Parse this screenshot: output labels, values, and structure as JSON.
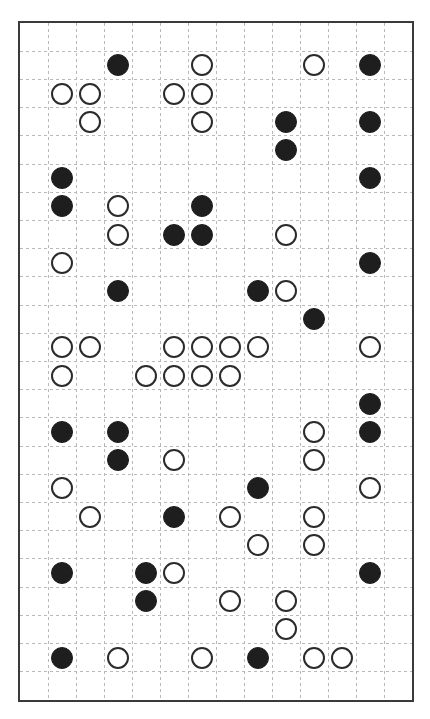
{
  "canvas": {
    "width": 430,
    "height": 719,
    "background": "#ffffff"
  },
  "board": {
    "label": "dashed-grid-board",
    "left": 18,
    "top": 21,
    "width": 396,
    "height": 681,
    "border_color": "#3a3a3a",
    "border_width": 2,
    "grid_color": "#b9b9b9",
    "grid_dash": "3 3",
    "columns": 14,
    "rows": 24,
    "cell_size": 28.3
  },
  "stones": {
    "black_color": "#1e1e1e",
    "white_fill": "#ffffff",
    "white_stroke": "#2b2b2b",
    "diameter": 22,
    "black_count": 34,
    "white_count": 45,
    "total_count": 79,
    "items": [
      {
        "row": 1,
        "col": 3,
        "color": "black"
      },
      {
        "row": 1,
        "col": 6,
        "color": "white"
      },
      {
        "row": 1,
        "col": 10,
        "color": "white"
      },
      {
        "row": 1,
        "col": 12,
        "color": "black"
      },
      {
        "row": 2,
        "col": 1,
        "color": "white"
      },
      {
        "row": 2,
        "col": 2,
        "color": "white"
      },
      {
        "row": 2,
        "col": 5,
        "color": "white"
      },
      {
        "row": 2,
        "col": 6,
        "color": "white"
      },
      {
        "row": 3,
        "col": 2,
        "color": "white"
      },
      {
        "row": 3,
        "col": 6,
        "color": "white"
      },
      {
        "row": 3,
        "col": 9,
        "color": "black"
      },
      {
        "row": 3,
        "col": 12,
        "color": "black"
      },
      {
        "row": 4,
        "col": 9,
        "color": "black"
      },
      {
        "row": 5,
        "col": 1,
        "color": "black"
      },
      {
        "row": 5,
        "col": 12,
        "color": "black"
      },
      {
        "row": 6,
        "col": 1,
        "color": "black"
      },
      {
        "row": 6,
        "col": 3,
        "color": "white"
      },
      {
        "row": 6,
        "col": 6,
        "color": "black"
      },
      {
        "row": 7,
        "col": 3,
        "color": "white"
      },
      {
        "row": 7,
        "col": 5,
        "color": "black"
      },
      {
        "row": 7,
        "col": 6,
        "color": "black"
      },
      {
        "row": 7,
        "col": 9,
        "color": "white"
      },
      {
        "row": 8,
        "col": 1,
        "color": "white"
      },
      {
        "row": 8,
        "col": 12,
        "color": "black"
      },
      {
        "row": 9,
        "col": 3,
        "color": "black"
      },
      {
        "row": 9,
        "col": 8,
        "color": "black"
      },
      {
        "row": 9,
        "col": 9,
        "color": "white"
      },
      {
        "row": 10,
        "col": 10,
        "color": "black"
      },
      {
        "row": 11,
        "col": 1,
        "color": "white"
      },
      {
        "row": 11,
        "col": 2,
        "color": "white"
      },
      {
        "row": 11,
        "col": 5,
        "color": "white"
      },
      {
        "row": 11,
        "col": 6,
        "color": "white"
      },
      {
        "row": 11,
        "col": 7,
        "color": "white"
      },
      {
        "row": 11,
        "col": 8,
        "color": "white"
      },
      {
        "row": 11,
        "col": 12,
        "color": "white"
      },
      {
        "row": 12,
        "col": 1,
        "color": "white"
      },
      {
        "row": 12,
        "col": 4,
        "color": "white"
      },
      {
        "row": 12,
        "col": 5,
        "color": "white"
      },
      {
        "row": 12,
        "col": 6,
        "color": "white"
      },
      {
        "row": 12,
        "col": 7,
        "color": "white"
      },
      {
        "row": 13,
        "col": 12,
        "color": "black"
      },
      {
        "row": 14,
        "col": 1,
        "color": "black"
      },
      {
        "row": 14,
        "col": 3,
        "color": "black"
      },
      {
        "row": 14,
        "col": 10,
        "color": "white"
      },
      {
        "row": 14,
        "col": 12,
        "color": "black"
      },
      {
        "row": 15,
        "col": 3,
        "color": "black"
      },
      {
        "row": 15,
        "col": 5,
        "color": "white"
      },
      {
        "row": 15,
        "col": 10,
        "color": "white"
      },
      {
        "row": 16,
        "col": 1,
        "color": "white"
      },
      {
        "row": 16,
        "col": 8,
        "color": "black"
      },
      {
        "row": 16,
        "col": 12,
        "color": "white"
      },
      {
        "row": 17,
        "col": 2,
        "color": "white"
      },
      {
        "row": 17,
        "col": 5,
        "color": "black"
      },
      {
        "row": 17,
        "col": 7,
        "color": "white"
      },
      {
        "row": 17,
        "col": 10,
        "color": "white"
      },
      {
        "row": 18,
        "col": 8,
        "color": "white"
      },
      {
        "row": 18,
        "col": 10,
        "color": "white"
      },
      {
        "row": 19,
        "col": 1,
        "color": "black"
      },
      {
        "row": 19,
        "col": 4,
        "color": "black"
      },
      {
        "row": 19,
        "col": 5,
        "color": "white"
      },
      {
        "row": 19,
        "col": 12,
        "color": "black"
      },
      {
        "row": 20,
        "col": 4,
        "color": "black"
      },
      {
        "row": 20,
        "col": 7,
        "color": "white"
      },
      {
        "row": 20,
        "col": 9,
        "color": "white"
      },
      {
        "row": 21,
        "col": 9,
        "color": "white"
      },
      {
        "row": 22,
        "col": 1,
        "color": "black"
      },
      {
        "row": 22,
        "col": 3,
        "color": "white"
      },
      {
        "row": 22,
        "col": 6,
        "color": "white"
      },
      {
        "row": 22,
        "col": 8,
        "color": "black"
      },
      {
        "row": 22,
        "col": 10,
        "color": "white"
      },
      {
        "row": 22,
        "col": 11,
        "color": "white"
      }
    ]
  }
}
